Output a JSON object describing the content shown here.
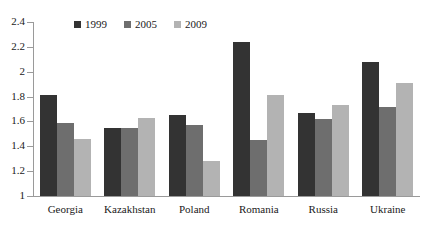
{
  "chart_data": {
    "type": "bar",
    "title": "",
    "subtitle": "",
    "xlabel": "",
    "ylabel": "",
    "ylim": [
      1,
      2.4
    ],
    "ytick_step": 0.2,
    "yticks": [
      "1",
      "1.2",
      "1.4",
      "1.6",
      "1.8",
      "2",
      "2.2",
      "2.4"
    ],
    "grid": false,
    "legend_position": "top-center",
    "categories": [
      "Georgia",
      "Kazakhstan",
      "Poland",
      "Romania",
      "Russia",
      "Ukraine"
    ],
    "series": [
      {
        "name": "1999",
        "color": "#333333",
        "values": [
          1.81,
          1.55,
          1.65,
          2.24,
          1.67,
          2.08
        ]
      },
      {
        "name": "2005",
        "color": "#6e6e6e",
        "values": [
          1.59,
          1.55,
          1.57,
          1.45,
          1.62,
          1.72
        ]
      },
      {
        "name": "2009",
        "color": "#b3b3b3",
        "values": [
          1.46,
          1.63,
          1.28,
          1.81,
          1.73,
          1.91
        ]
      }
    ]
  }
}
